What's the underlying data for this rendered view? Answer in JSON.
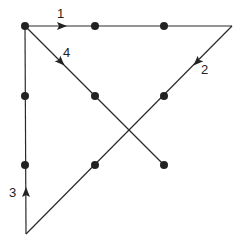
{
  "diagram": {
    "title": "",
    "dots": [
      {
        "x": 25,
        "y": 26
      },
      {
        "x": 95,
        "y": 26
      },
      {
        "x": 164,
        "y": 26
      },
      {
        "x": 25,
        "y": 96
      },
      {
        "x": 95,
        "y": 96
      },
      {
        "x": 164,
        "y": 96
      },
      {
        "x": 25,
        "y": 165
      },
      {
        "x": 95,
        "y": 165
      },
      {
        "x": 164,
        "y": 165
      }
    ],
    "lines": [
      {
        "id": 1,
        "label": "1",
        "from": [
          25,
          26
        ],
        "to": [
          232,
          26
        ]
      },
      {
        "id": 2,
        "label": "2",
        "from": [
          232,
          26
        ],
        "to": [
          26,
          234
        ]
      },
      {
        "id": 3,
        "label": "3",
        "from": [
          26,
          234
        ],
        "to": [
          25,
          26
        ]
      },
      {
        "id": 4,
        "label": "4",
        "from": [
          25,
          26
        ],
        "to": [
          164,
          165
        ]
      }
    ],
    "labels": {
      "l1": "1",
      "l2": "2",
      "l3": "3",
      "l4": "4"
    },
    "colors": {
      "line": "#2a2a2a",
      "dot": "#222222",
      "background": "#ffffff"
    }
  }
}
